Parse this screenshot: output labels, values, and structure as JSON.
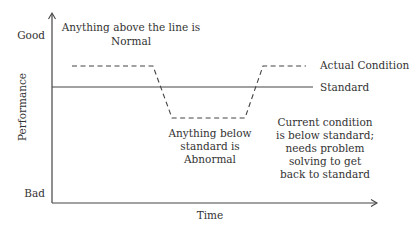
{
  "diagram": {
    "y_axis": {
      "label": "Performance",
      "top_label": "Good",
      "bottom_label": "Bad"
    },
    "x_axis": {
      "label": "Time"
    },
    "lines": {
      "actual_label": "Actual Condition",
      "standard_label": "Standard"
    },
    "annotations": {
      "above": [
        "Anything above the line is",
        "Normal"
      ],
      "below": [
        "Anything below",
        "standard is",
        "Abnormal"
      ],
      "current": [
        "Current condition",
        "is below standard;",
        "needs problem",
        "solving to get",
        "back to standard"
      ]
    },
    "colors": {
      "axis": "#444444",
      "text": "#333333",
      "background": "#ffffff"
    }
  }
}
